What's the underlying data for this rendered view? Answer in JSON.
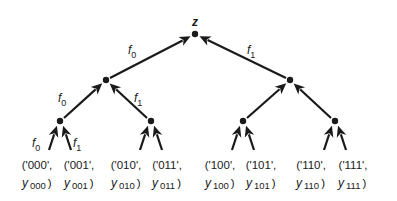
{
  "diagram": {
    "type": "binary-tree",
    "root": {
      "label": "z"
    },
    "edge_label_prefix": "f",
    "edge_labels": [
      {
        "level": 1,
        "side": "left",
        "name": "f",
        "sub": "0"
      },
      {
        "level": 1,
        "side": "right",
        "name": "f",
        "sub": "1"
      },
      {
        "level": 2,
        "side": "left",
        "name": "f",
        "sub": "0"
      },
      {
        "level": 2,
        "side": "right",
        "name": "f",
        "sub": "1"
      },
      {
        "level": 3,
        "side": "left",
        "name": "f",
        "sub": "0"
      },
      {
        "level": 3,
        "side": "right",
        "name": "f",
        "sub": "1"
      }
    ],
    "leaves": [
      {
        "key": "'000'",
        "y": "y",
        "sub": "000"
      },
      {
        "key": "'001'",
        "y": "y",
        "sub": "001"
      },
      {
        "key": "'010'",
        "y": "y",
        "sub": "010"
      },
      {
        "key": "'011'",
        "y": "y",
        "sub": "011"
      },
      {
        "key": "'100'",
        "y": "y",
        "sub": "100"
      },
      {
        "key": "'101'",
        "y": "y",
        "sub": "101"
      },
      {
        "key": "'110'",
        "y": "y",
        "sub": "110"
      },
      {
        "key": "'111'",
        "y": "y",
        "sub": "111"
      }
    ],
    "colors": {
      "ink": "#1a1a1a",
      "background": "#ffffff"
    }
  }
}
